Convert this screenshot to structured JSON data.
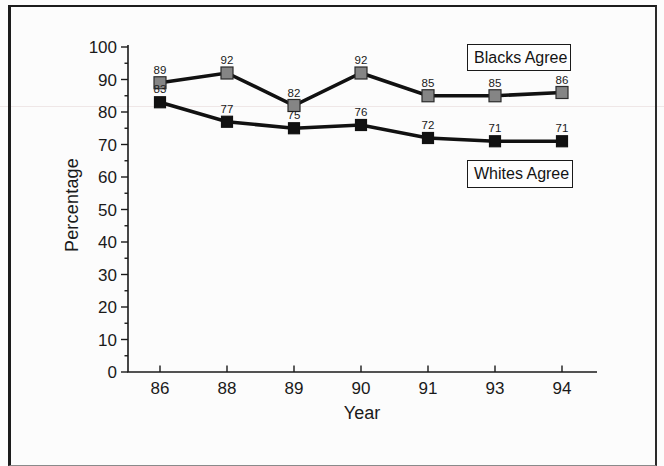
{
  "figure": {
    "background": "#fcfcfc",
    "frame_color": "#1c1c1c"
  },
  "chart_data": {
    "type": "line",
    "title": "",
    "xlabel": "Year",
    "ylabel": "Percentage",
    "ylim": [
      0,
      100
    ],
    "ytick_step": 10,
    "ytick_minor_step": 5,
    "categories": [
      "86",
      "88",
      "89",
      "90",
      "91",
      "93",
      "94"
    ],
    "series": [
      {
        "name": "Blacks Agree",
        "values": [
          89,
          92,
          82,
          92,
          85,
          85,
          86
        ],
        "line_color": "#111111",
        "marker_color": "#858585",
        "marker_edge": "#2b2b2b",
        "marker_size": 12
      },
      {
        "name": "Whites Agree",
        "values": [
          83,
          77,
          75,
          76,
          72,
          71,
          71
        ],
        "line_color": "#111111",
        "marker_color": "#111111",
        "marker_edge": "#111111",
        "marker_size": 11
      }
    ],
    "axis_color": "#1a1a1a",
    "value_label_color": "#262626",
    "grid": false,
    "legend_position": "inside-right"
  }
}
